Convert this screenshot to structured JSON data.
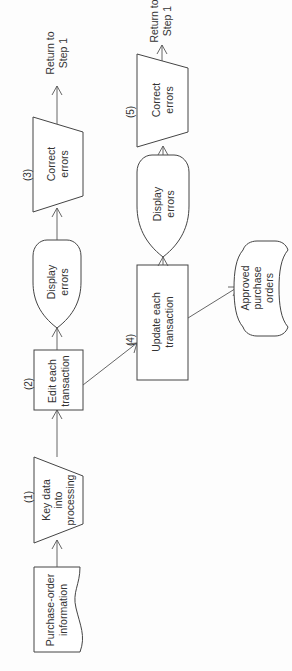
{
  "diagram": {
    "type": "flowchart",
    "orientation": "rotated-90-ccw",
    "nodes": {
      "po_info": {
        "shape": "document",
        "lines": [
          "Purchase-order",
          "information"
        ]
      },
      "key_data": {
        "shape": "manual-input",
        "step": "(1)",
        "lines": [
          "Key data",
          "into",
          "processing"
        ]
      },
      "edit": {
        "shape": "process",
        "step": "(2)",
        "lines": [
          "Edit each",
          "transaction"
        ]
      },
      "display1": {
        "shape": "display",
        "lines": [
          "Display",
          "errors"
        ]
      },
      "correct1": {
        "shape": "manual-operation",
        "step": "(3)",
        "lines": [
          "Correct",
          "errors"
        ]
      },
      "return1": {
        "shape": "text",
        "lines": [
          "Return to",
          "Step 1"
        ]
      },
      "update": {
        "shape": "process",
        "step": "(4)",
        "lines": [
          "Update each",
          "transaction"
        ]
      },
      "display2": {
        "shape": "display",
        "lines": [
          "Display",
          "errors"
        ]
      },
      "correct2": {
        "shape": "manual-operation",
        "step": "(5)",
        "lines": [
          "Correct",
          "errors"
        ]
      },
      "return2": {
        "shape": "text",
        "lines": [
          "Return to",
          "Step 1"
        ]
      },
      "approved": {
        "shape": "stored-data",
        "lines": [
          "Approved",
          "purchase",
          "orders"
        ]
      }
    },
    "edges": [
      [
        "po_info",
        "key_data"
      ],
      [
        "key_data",
        "edit"
      ],
      [
        "edit",
        "display1"
      ],
      [
        "display1",
        "correct1"
      ],
      [
        "correct1",
        "return1"
      ],
      [
        "edit",
        "update"
      ],
      [
        "update",
        "display2"
      ],
      [
        "display2",
        "correct2"
      ],
      [
        "correct2",
        "return2"
      ],
      [
        "update",
        "approved"
      ]
    ],
    "colors": {
      "stroke": "#444444",
      "text": "#333333",
      "background": "#fdfdfd"
    }
  }
}
